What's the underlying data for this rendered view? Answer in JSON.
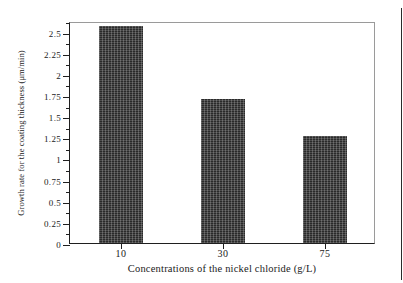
{
  "chart_data": {
    "type": "bar",
    "title": "",
    "subtitle": "",
    "categories": [
      "10",
      "30",
      "75"
    ],
    "values": [
      2.57,
      1.7,
      1.26
    ],
    "series": [
      {
        "name": "Growth rate for the coating thickness",
        "values": [
          2.57,
          1.7,
          1.26
        ]
      }
    ],
    "xlabel": "Concentrations of the nickel chloride (g/L)",
    "ylabel": "Growth rate for the coating thickness (μm/min)",
    "ylim": [
      0,
      2.625
    ],
    "xlim": [
      0,
      3
    ],
    "ytick_labels": [
      "0",
      "0.25",
      "0.5",
      "0.75",
      "1",
      "1.25",
      "1.5",
      "1.75",
      "2",
      "2.25",
      "2.5"
    ],
    "ytick_values": [
      0,
      0.25,
      0.5,
      0.75,
      1,
      1.25,
      1.5,
      1.75,
      2,
      2.25,
      2.5
    ],
    "ytick_minor_values": [
      0.125,
      0.375,
      0.625,
      0.875,
      1.125,
      1.375,
      1.625,
      1.875,
      2.125,
      2.375,
      2.625
    ],
    "xtick_labels": [
      "10",
      "30",
      "75"
    ],
    "grid": false,
    "legend": null,
    "legend_position": "none",
    "bar_color": "#2a2a2a",
    "axis_color": "#1f1f1f",
    "frame_color": "#9a9a9a",
    "background_color": "#ffffff",
    "annotations": []
  }
}
